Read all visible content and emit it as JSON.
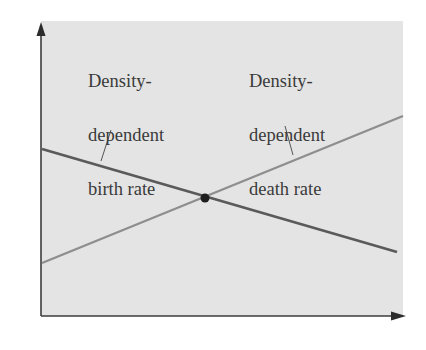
{
  "figure": {
    "type": "diagram",
    "background_color": "#e4e4e4",
    "labels": {
      "birth": {
        "lines": [
          "Density-",
          "dependent",
          "birth rate"
        ]
      },
      "death": {
        "lines": [
          "Density-",
          "dependent",
          "death rate"
        ]
      }
    },
    "colors": {
      "birth_line": "#5a5a5a",
      "death_line": "#8e8e8e",
      "axes": "#3c3c3c",
      "equilibrium_point": "#1e1e1e"
    },
    "lines": {
      "birth_rate": {
        "x1": 42,
        "y1": 149,
        "x2": 397,
        "y2": 252,
        "trend": "decreasing"
      },
      "death_rate": {
        "x1": 42,
        "y1": 263,
        "x2": 403,
        "y2": 116,
        "trend": "increasing"
      }
    },
    "equilibrium": {
      "x": 205,
      "y": 198,
      "description": "intersection of birth and death rates"
    },
    "axes": {
      "x_label": "",
      "y_label": ""
    }
  }
}
